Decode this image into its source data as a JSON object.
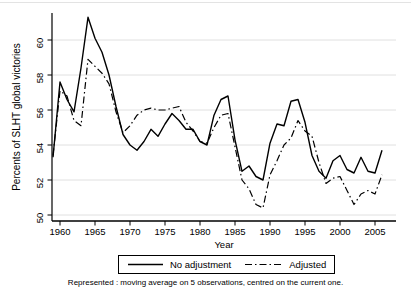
{
  "figure": {
    "caption": "Represented : moving average on 5 observations, centred on the current one."
  },
  "chart_data": {
    "type": "line",
    "title": "",
    "xlabel": "Year",
    "ylabel": "Percents of SLHT global victories",
    "x_ticks": [
      1960,
      1965,
      1970,
      1975,
      1980,
      1985,
      1990,
      1995,
      2000,
      2005
    ],
    "y_ticks": [
      50,
      52,
      54,
      56,
      58,
      60
    ],
    "xlim": [
      1958,
      2007.5
    ],
    "ylim": [
      49.5,
      61.6
    ],
    "grid": "horizontal-light-gray",
    "legend_position": "bottom-center-boxed",
    "line_color": "#000000",
    "grid_color": "#e0e0e0",
    "x": [
      1959,
      1960,
      1961,
      1962,
      1963,
      1964,
      1965,
      1966,
      1967,
      1968,
      1969,
      1970,
      1971,
      1972,
      1973,
      1974,
      1975,
      1976,
      1977,
      1978,
      1979,
      1980,
      1981,
      1982,
      1983,
      1984,
      1985,
      1986,
      1987,
      1988,
      1989,
      1990,
      1991,
      1992,
      1993,
      1994,
      1995,
      1996,
      1997,
      1998,
      1999,
      2000,
      2001,
      2002,
      2003,
      2004,
      2005,
      2006
    ],
    "series": [
      {
        "name": "No adjustment",
        "style": "solid",
        "values": [
          53.3,
          57.6,
          56.6,
          55.9,
          58.4,
          61.3,
          60.1,
          59.3,
          58.0,
          56.2,
          54.6,
          54.0,
          53.7,
          54.2,
          54.9,
          54.5,
          55.2,
          55.8,
          55.4,
          54.9,
          54.9,
          54.2,
          54.0,
          55.7,
          56.6,
          56.8,
          54.3,
          52.5,
          52.8,
          52.2,
          52.0,
          54.1,
          55.2,
          55.1,
          56.5,
          56.6,
          55.3,
          53.4,
          52.5,
          52.1,
          53.1,
          53.4,
          52.6,
          52.4,
          53.3,
          52.5,
          52.4,
          53.7
        ]
      },
      {
        "name": "Adjusted",
        "style": "dash-dot",
        "values": [
          53.4,
          57.1,
          56.8,
          55.4,
          55.1,
          58.9,
          58.5,
          58.1,
          57.5,
          55.9,
          54.7,
          55.1,
          55.7,
          56.0,
          56.1,
          56.0,
          56.0,
          56.1,
          56.2,
          55.3,
          54.8,
          54.2,
          54.1,
          55.0,
          55.7,
          55.8,
          53.9,
          52.0,
          51.5,
          50.6,
          50.4,
          52.3,
          53.1,
          54.0,
          54.4,
          55.4,
          54.8,
          54.5,
          53.0,
          51.8,
          52.1,
          52.2,
          51.4,
          50.6,
          51.2,
          51.4,
          51.2,
          52.3
        ]
      }
    ]
  }
}
